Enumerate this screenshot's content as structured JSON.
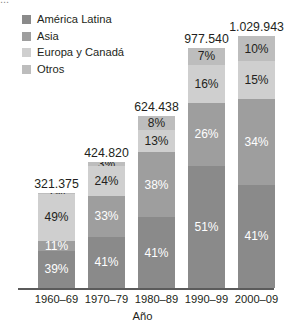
{
  "top_clipped_text": "...",
  "legend": {
    "items": [
      {
        "label": "América Latina",
        "color": "#8a8a8a"
      },
      {
        "label": "Asia",
        "color": "#9e9e9e"
      },
      {
        "label": "Europa y Canadá",
        "color": "#cfcfcf"
      },
      {
        "label": "Otros",
        "color": "#bdbdbd"
      }
    ]
  },
  "chart_data": {
    "type": "bar",
    "subtype": "stacked-percentage",
    "title": "",
    "xlabel": "Año",
    "ylabel": "",
    "grid": false,
    "legend_position": "top-left",
    "categories": [
      "1960–69",
      "1970–79",
      "1980–89",
      "1990–99",
      "2000–09"
    ],
    "totals": [
      "321.375",
      "424.820",
      "624.438",
      "977.540",
      "1.029.943"
    ],
    "totals_numeric": [
      321375,
      424820,
      624438,
      977540,
      1029943
    ],
    "series": [
      {
        "name": "América Latina",
        "color": "#8a8a8a",
        "values": [
          39,
          41,
          41,
          51,
          41
        ],
        "labels": [
          "39%",
          "41%",
          "41%",
          "51%",
          "41%"
        ],
        "label_color": "#ffffff"
      },
      {
        "name": "Asia",
        "color": "#9e9e9e",
        "values": [
          11,
          33,
          38,
          26,
          34
        ],
        "labels": [
          "11%",
          "33%",
          "38%",
          "26%",
          "34%"
        ],
        "label_color": "#ffffff"
      },
      {
        "name": "Europa y Canadá",
        "color": "#cfcfcf",
        "values": [
          49,
          24,
          13,
          16,
          15
        ],
        "labels": [
          "49%",
          "24%",
          "13%",
          "16%",
          "15%"
        ],
        "label_color": "#231f20"
      },
      {
        "name": "Otros",
        "color": "#bdbdbd",
        "values": [
          1,
          3,
          8,
          7,
          10
        ],
        "labels": [
          "1%",
          "3%",
          "8%",
          "7%",
          "10%"
        ],
        "label_color": "#231f20"
      }
    ],
    "bar_pixel_heights": [
      95,
      126,
      172,
      240,
      252
    ]
  }
}
